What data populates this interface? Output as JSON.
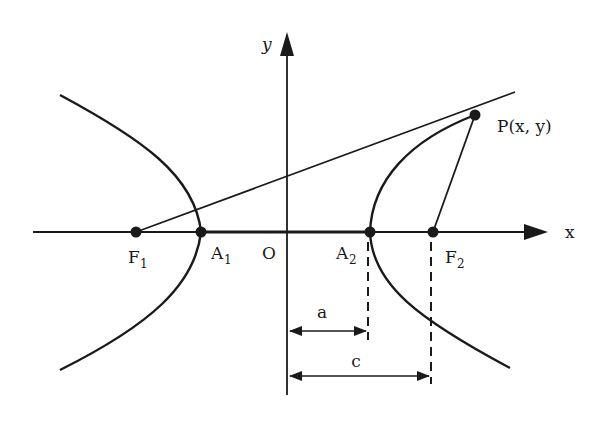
{
  "diagram": {
    "type": "hyperbola-definition",
    "colors": {
      "ink": "#1a1a1a",
      "background": "#ffffff"
    },
    "axes": {
      "x_label": "x",
      "y_label": "y",
      "origin_label": "O"
    },
    "points": {
      "F1": {
        "main": "F",
        "sub": "1"
      },
      "F2": {
        "main": "F",
        "sub": "2"
      },
      "A1": {
        "main": "A",
        "sub": "1"
      },
      "A2": {
        "main": "A",
        "sub": "2"
      },
      "P": {
        "label": "P(x, y)"
      }
    },
    "dimensions": {
      "a": "a",
      "c": "c"
    }
  }
}
